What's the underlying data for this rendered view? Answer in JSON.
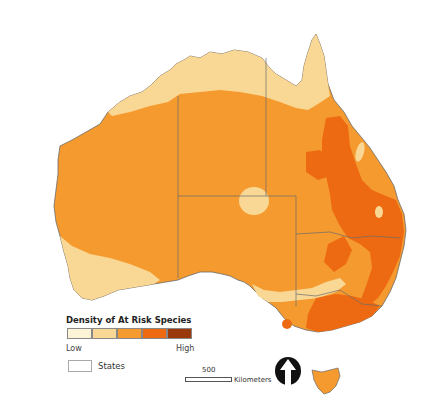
{
  "map": {
    "title": "Density of At Risk Species",
    "region": "Australia",
    "legend": {
      "title": "Density of At Risk Species",
      "classes": [
        {
          "level": 1,
          "color": "#fdf3d6"
        },
        {
          "level": 2,
          "color": "#f9d896"
        },
        {
          "level": 3,
          "color": "#f59a2e"
        },
        {
          "level": 4,
          "color": "#ed6a12"
        },
        {
          "level": 5,
          "color": "#9a3a0c"
        }
      ],
      "low_label": "Low",
      "high_label": "High",
      "states_label": "States"
    },
    "scale_bar": {
      "value": "500",
      "unit": "Kilometers"
    },
    "north_arrow": "north-arrow-icon",
    "colors": {
      "base": "#f59a2e",
      "light": "#f9d896",
      "high": "#ed6a12",
      "border": "#6b6b6b"
    }
  }
}
